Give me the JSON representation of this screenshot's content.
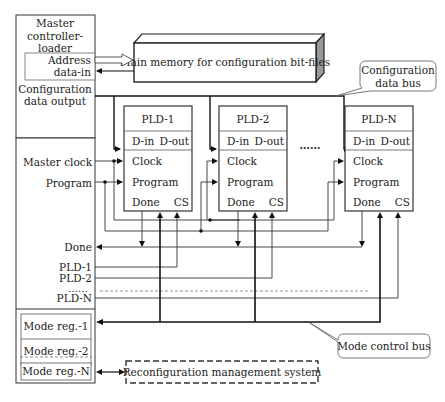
{
  "controller": {
    "title_lines": [
      "Master",
      "controller-",
      "loader"
    ],
    "address_lines": [
      "Address",
      "data-in"
    ],
    "config_output_lines": [
      "Configuration",
      "data output"
    ],
    "master_clock": "Master clock",
    "program": "Program",
    "done": "Done",
    "pld_lines": [
      "PLD-1",
      "PLD-2",
      "……",
      "PLD-N"
    ],
    "mode_regs": [
      "Mode reg.-1",
      "Mode reg.-2",
      "Mode reg.-N"
    ]
  },
  "memory": {
    "label": "Main memory for configuration bit-files"
  },
  "callouts": {
    "config_bus_lines": [
      "Configuration",
      "data bus"
    ],
    "mode_bus": "Mode control bus"
  },
  "plds": [
    {
      "title": "PLD-1",
      "din": "D-in",
      "dout": "D-out",
      "clock": "Clock",
      "program": "Program",
      "done": "Done",
      "cs": "CS"
    },
    {
      "title": "PLD-2",
      "din": "D-in",
      "dout": "D-out",
      "clock": "Clock",
      "program": "Program",
      "done": "Done",
      "cs": "CS"
    },
    {
      "title": "PLD-N",
      "din": "D-in",
      "dout": "D-out",
      "clock": "Clock",
      "program": "Program",
      "done": "Done",
      "cs": "CS"
    }
  ],
  "ellipsis": "……",
  "reconfig": {
    "label": "Reconfiguration management system"
  }
}
